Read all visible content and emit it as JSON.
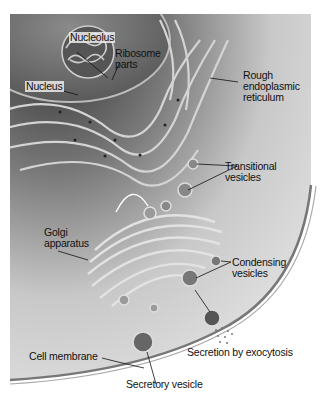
{
  "diagram": {
    "colors": {
      "cytoplasm_dark": "#3a3a3a",
      "cytoplasm_light": "#d8d8d8",
      "nucleus": "#6a6a6a",
      "membrane": "#9a9a9a",
      "background": "#ffffff"
    },
    "labels": {
      "nucleolus": "Nucleolus",
      "ribosome_parts": "Ribosome\nparts",
      "nucleus": "Nucleus",
      "rough_er": "Rough\nendoplasmic\nreticulum",
      "transitional_vesicles": "Transitional\nvesicles",
      "golgi": "Golgi\napparatus",
      "condensing_vesicles": "Condensing\nvesicles",
      "cell_membrane": "Cell membrane",
      "secretion": "Secretion by exocytosis",
      "secretory_vesicle": "Secretory vesicle"
    }
  }
}
